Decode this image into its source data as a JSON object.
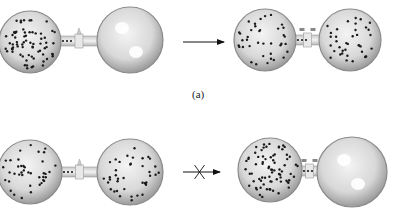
{
  "figure": {
    "panel_a_label": "(a)",
    "panels": [
      {
        "id": "a",
        "left_apparatus": {
          "flask_left": {
            "cx": 30,
            "cy": 42,
            "r": 31,
            "dots": 70
          },
          "flask_right": {
            "cx": 130,
            "cy": 40,
            "r": 33,
            "dots": 0
          },
          "valve": "closed",
          "tube_dots": 3
        },
        "arrow": {
          "x1": 183,
          "x2": 224,
          "y": 42,
          "crossed": false
        },
        "right_apparatus": {
          "flask_left": {
            "cx": 265,
            "cy": 40,
            "r": 31,
            "dots": 38
          },
          "flask_right": {
            "cx": 350,
            "cy": 40,
            "r": 31,
            "dots": 38
          },
          "valve": "open",
          "tube_dots": 3
        }
      },
      {
        "id": "b",
        "left_apparatus": {
          "flask_left": {
            "cx": 30,
            "cy": 172,
            "r": 32,
            "dots": 40
          },
          "flask_right": {
            "cx": 130,
            "cy": 172,
            "r": 33,
            "dots": 40
          },
          "valve": "closed",
          "tube_dots": 3
        },
        "arrow": {
          "x1": 183,
          "x2": 220,
          "y": 172,
          "crossed": true
        },
        "right_apparatus": {
          "flask_left": {
            "cx": 270,
            "cy": 170,
            "r": 32,
            "dots": 75
          },
          "flask_right": {
            "cx": 352,
            "cy": 172,
            "r": 35,
            "dots": 0
          },
          "valve": "open",
          "tube_dots": 3
        }
      }
    ],
    "colors": {
      "flask_edge": "#8a8a8a",
      "flask_fill": "#d6d6d6",
      "dot": "#1a1a1a",
      "arrow": "#111111"
    }
  }
}
